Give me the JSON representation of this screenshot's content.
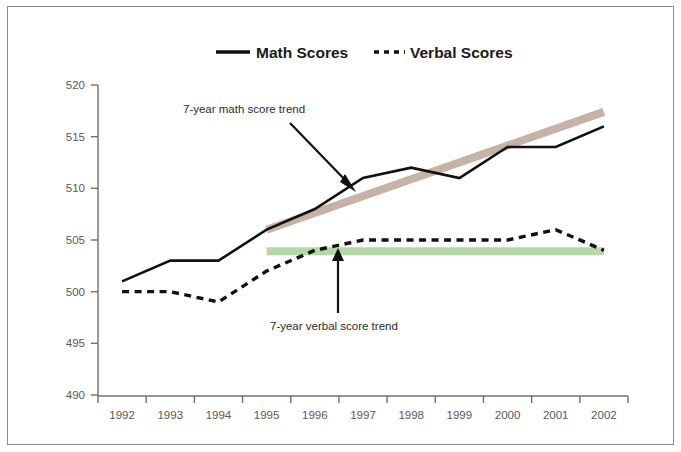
{
  "figure": {
    "border_color": "#8b8b8b",
    "background": "#ffffff"
  },
  "legend": {
    "position": "top-center",
    "entries": [
      {
        "label": "Math Scores",
        "style": "solid",
        "color": "#111111"
      },
      {
        "label": "Verbal Scores",
        "style": "dashed",
        "color": "#111111"
      }
    ]
  },
  "annotations": [
    {
      "name": "math-trend-annotation",
      "text": "7-year math score trend"
    },
    {
      "name": "verbal-trend-annotation",
      "text": "7-year verbal score trend"
    }
  ],
  "colors": {
    "math_line": "#111111",
    "verbal_line": "#111111",
    "math_trend": "#c6b2a6",
    "verbal_trend": "#b5d9a6",
    "axis": "#6f6f6f",
    "tick_text": "#58585a"
  },
  "chart_data": {
    "type": "line",
    "title": "",
    "subtitle": "",
    "xlabel": "",
    "ylabel": "",
    "categories": [
      "1992",
      "1993",
      "1994",
      "1995",
      "1996",
      "1997",
      "1998",
      "1999",
      "2000",
      "2001",
      "2002"
    ],
    "ylim": [
      490,
      520
    ],
    "yticks": [
      490,
      495,
      500,
      505,
      510,
      515,
      520
    ],
    "grid": false,
    "legend_position": "top-center",
    "series": [
      {
        "name": "Math Scores",
        "style": "solid",
        "color": "#111111",
        "values": [
          501,
          503,
          503,
          506,
          508,
          511,
          512,
          511,
          514,
          514,
          516
        ]
      },
      {
        "name": "Verbal Scores",
        "style": "dashed",
        "color": "#111111",
        "values": [
          500,
          500,
          499,
          502,
          504,
          505,
          505,
          505,
          505,
          506,
          504
        ]
      }
    ],
    "trend_lines": [
      {
        "name": "7-year math score trend",
        "color": "#c6b2a6",
        "start": {
          "x": "1995",
          "y": 506.0
        },
        "end": {
          "x": "2002",
          "y": 517.4
        }
      },
      {
        "name": "7-year verbal score trend",
        "color": "#b5d9a6",
        "start": {
          "x": "1995",
          "y": 503.9
        },
        "end": {
          "x": "2002",
          "y": 503.9
        }
      }
    ]
  }
}
